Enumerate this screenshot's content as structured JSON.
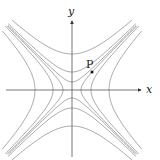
{
  "diagram": {
    "x_axis_label": "x",
    "y_axis_label": "y",
    "point_label": "P",
    "origin_px": [
      72,
      90
    ],
    "curve_extent_px": 64,
    "family_xy": {
      "equation": "x^2 - y^2 = c",
      "vertices_px": [
        9,
        19,
        37
      ]
    },
    "family_yx": {
      "equation": "y^2 - x^2 = c",
      "vertices_px": [
        8,
        18,
        36
      ]
    },
    "point_px": [
      92,
      72
    ],
    "colors": {
      "curve": "#8a8a8a",
      "axis": "#555555",
      "text": "#222222",
      "point": "#111111"
    }
  }
}
